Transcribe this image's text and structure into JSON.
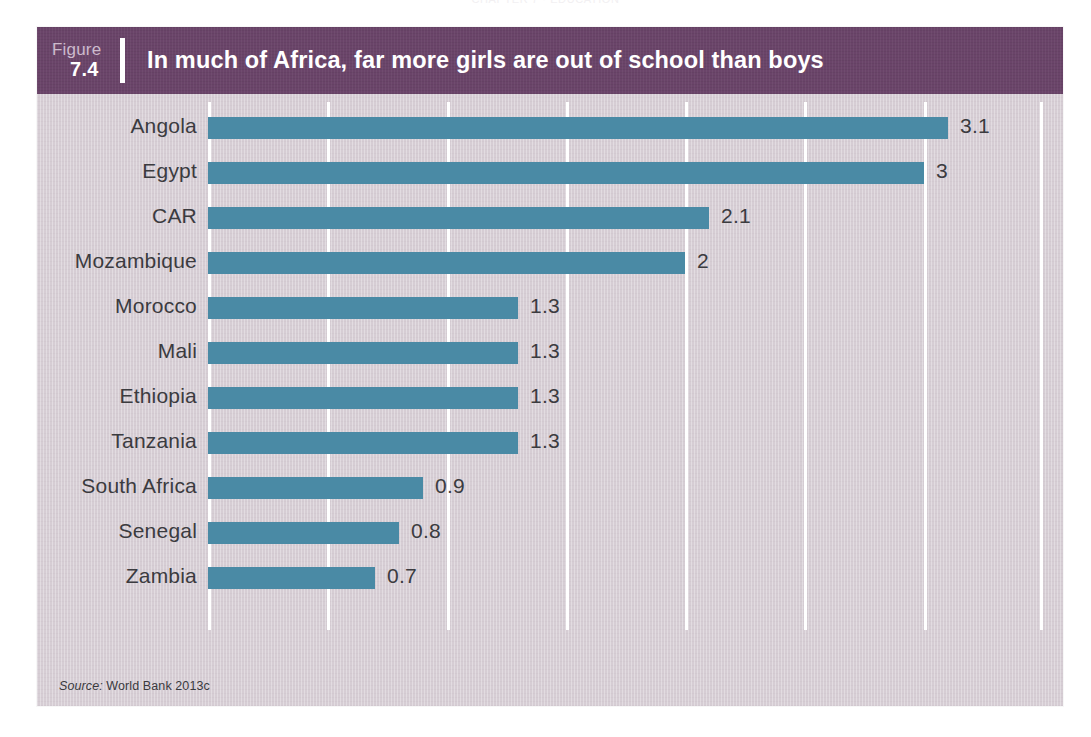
{
  "page": {
    "running_head": "CHAPTER 7  ·  EDUCATION",
    "folio": ""
  },
  "figure": {
    "figure_word": "Figure",
    "figure_number": "7.4",
    "title": "In much of Africa, far more girls are out of school than boys",
    "source_label": "Source:",
    "source_text": " World Bank 2013c",
    "header_color": "#6a4469",
    "panel_background": "#d6cdd4",
    "bar_color": "#4a8aa5",
    "gridline_color": "#ffffff",
    "label_color": "#3b3b3f"
  },
  "chart_data": {
    "type": "bar",
    "orientation": "horizontal",
    "title": "In much of Africa, far more girls are out of school than boys",
    "subtitle": "",
    "xlabel": "",
    "ylabel": "",
    "categories": [
      "Angola",
      "Egypt",
      "CAR",
      "Mozambique",
      "Morocco",
      "Mali",
      "Ethiopia",
      "Tanzania",
      "South Africa",
      "Senegal",
      "Zambia"
    ],
    "values": [
      3.1,
      3,
      2.1,
      2,
      1.3,
      1.3,
      1.3,
      1.3,
      0.9,
      0.8,
      0.7
    ],
    "value_labels": [
      "3.1",
      "3",
      "2.1",
      "2",
      "1.3",
      "1.3",
      "1.3",
      "1.3",
      "0.9",
      "0.8",
      "0.7"
    ],
    "xlim": [
      0,
      3.5
    ],
    "xticks": [
      0,
      0.5,
      1.0,
      1.5,
      2.0,
      2.5,
      3.0,
      3.5
    ],
    "xtick_labels": [
      "",
      "",
      "",
      "",
      "",
      "",
      "",
      ""
    ],
    "grid": true,
    "grid_axis": "x",
    "legend": false,
    "legend_position": "none",
    "data_labels": true,
    "series": [
      {
        "name": "Ratio of out-of-school girls to boys",
        "values": [
          3.1,
          3,
          2.1,
          2,
          1.3,
          1.3,
          1.3,
          1.3,
          0.9,
          0.8,
          0.7
        ],
        "color": "#4a8aa5"
      }
    ]
  }
}
